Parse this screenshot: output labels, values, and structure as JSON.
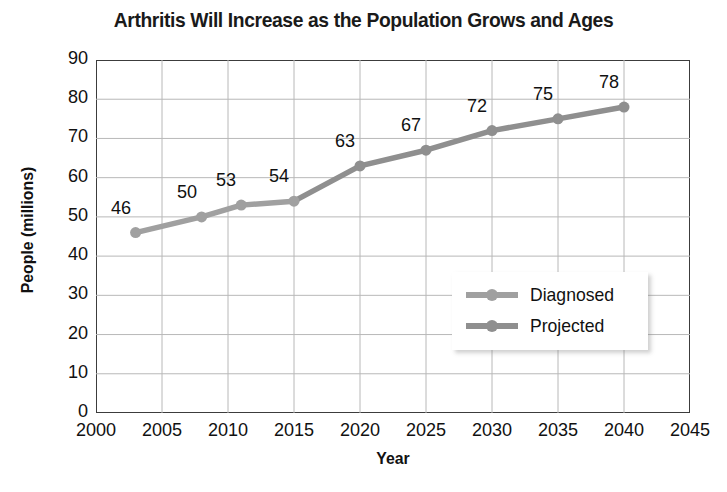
{
  "chart_data": {
    "type": "line",
    "title": "Arthritis Will Increase as the Population Grows and Ages",
    "xlabel": "Year",
    "ylabel": "People (millions)",
    "xlim": [
      2000,
      2045
    ],
    "ylim": [
      0,
      90
    ],
    "xticks": [
      2000,
      2005,
      2010,
      2015,
      2020,
      2025,
      2030,
      2035,
      2040,
      2045
    ],
    "yticks": [
      0,
      10,
      20,
      30,
      40,
      50,
      60,
      70,
      80,
      90
    ],
    "grid": true,
    "legend_position": "center-right",
    "series": [
      {
        "name": "Diagnosed",
        "color": "#a0a0a0",
        "x": [
          2003,
          2008,
          2011,
          2015
        ],
        "values": [
          46,
          50,
          53,
          54
        ]
      },
      {
        "name": "Projected",
        "color": "#8f8f8f",
        "x": [
          2020,
          2025,
          2030,
          2035,
          2040
        ],
        "values": [
          63,
          67,
          72,
          75,
          78
        ]
      }
    ],
    "point_labels": [
      {
        "x": 2003,
        "y": 46,
        "text": "46"
      },
      {
        "x": 2008,
        "y": 50,
        "text": "50"
      },
      {
        "x": 2011,
        "y": 53,
        "text": "53"
      },
      {
        "x": 2015,
        "y": 54,
        "text": "54"
      },
      {
        "x": 2020,
        "y": 63,
        "text": "63"
      },
      {
        "x": 2025,
        "y": 67,
        "text": "67"
      },
      {
        "x": 2030,
        "y": 72,
        "text": "72"
      },
      {
        "x": 2035,
        "y": 75,
        "text": "75"
      },
      {
        "x": 2040,
        "y": 78,
        "text": "78"
      }
    ],
    "colors": {
      "axis": "#3c3c3c",
      "grid": "#b8b8b8",
      "text": "#111111",
      "diagnosed": "#a0a0a0",
      "projected": "#8f8f8f"
    }
  },
  "legend": {
    "items": [
      {
        "label": "Diagnosed"
      },
      {
        "label": "Projected"
      }
    ]
  }
}
